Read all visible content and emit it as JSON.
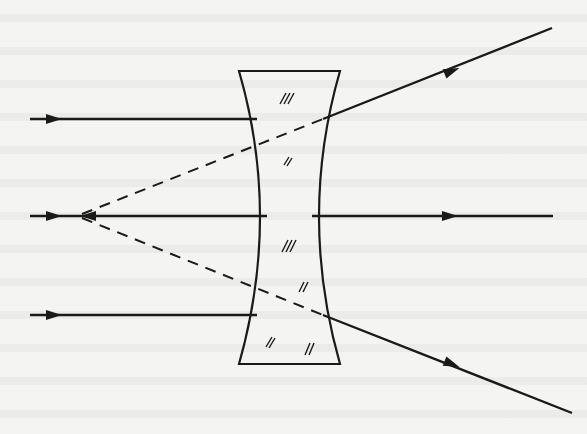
{
  "diagram": {
    "background_color": "#f4f4f2",
    "ink_color": "#1a1a1a",
    "lens": {
      "type": "biconcave",
      "top_y": 71,
      "bottom_y": 364,
      "outer_left_x": 239,
      "outer_right_x": 340,
      "inner_left_x": 267,
      "inner_right_x": 312,
      "center_y": 216,
      "hatch_marks": 6
    },
    "virtual_focus": {
      "x": 78,
      "y": 216,
      "label": ""
    },
    "incident_rays": [
      {
        "y": 119,
        "start_x": 30,
        "end_x": 257,
        "arrow_x": 52
      },
      {
        "y": 216,
        "start_x": 30,
        "end_x": 267,
        "arrow_x": 52
      },
      {
        "y": 315,
        "start_x": 30,
        "end_x": 257,
        "arrow_x": 52
      }
    ],
    "refracted_rays": [
      {
        "from": [
          323,
          119
        ],
        "to": [
          552,
          28
        ],
        "arrow_at": [
          450,
          70
        ]
      },
      {
        "from": [
          312,
          216
        ],
        "to": [
          553,
          216
        ],
        "arrow_at": [
          450,
          216
        ]
      },
      {
        "from": [
          323,
          315
        ],
        "to": [
          572,
          413
        ],
        "arrow_at": [
          450,
          364
        ]
      }
    ],
    "virtual_extensions": [
      {
        "from": [
          78,
          216
        ],
        "to": [
          323,
          119
        ],
        "style": "dashed"
      },
      {
        "from": [
          78,
          216
        ],
        "to": [
          323,
          315
        ],
        "style": "dashed"
      }
    ]
  }
}
